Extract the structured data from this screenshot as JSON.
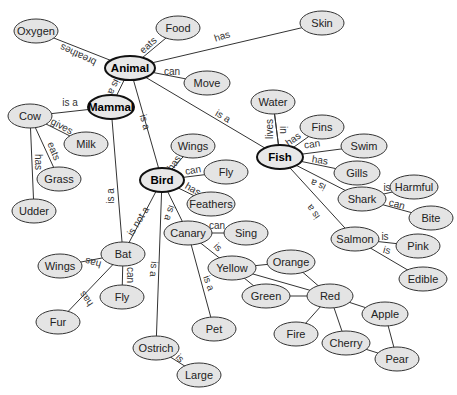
{
  "diagram": {
    "type": "concept-map",
    "colors": {
      "node_fill": "#e4e4e4",
      "node_stroke": "#333333",
      "edge": "#333333",
      "main_node_stroke": "#111111"
    },
    "nodes": [
      {
        "id": "animal",
        "label": "Animal",
        "x": 130,
        "y": 68,
        "rx": 25,
        "ry": 12,
        "main": true
      },
      {
        "id": "mammal",
        "label": "Mammal",
        "x": 111,
        "y": 107,
        "rx": 23,
        "ry": 12,
        "main": true
      },
      {
        "id": "bird",
        "label": "Bird",
        "x": 162,
        "y": 180,
        "rx": 22,
        "ry": 12,
        "main": true
      },
      {
        "id": "fish",
        "label": "Fish",
        "x": 280,
        "y": 157,
        "rx": 23,
        "ry": 12,
        "main": true
      },
      {
        "id": "oxygen",
        "label": "Oxygen",
        "x": 36,
        "y": 31,
        "rx": 22,
        "ry": 12
      },
      {
        "id": "food",
        "label": "Food",
        "x": 178,
        "y": 28,
        "rx": 22,
        "ry": 12
      },
      {
        "id": "skin",
        "label": "Skin",
        "x": 322,
        "y": 23,
        "rx": 22,
        "ry": 12
      },
      {
        "id": "move",
        "label": "Move",
        "x": 207,
        "y": 83,
        "rx": 23,
        "ry": 12
      },
      {
        "id": "cow",
        "label": "Cow",
        "x": 30,
        "y": 116,
        "rx": 22,
        "ry": 12
      },
      {
        "id": "milk",
        "label": "Milk",
        "x": 86,
        "y": 144,
        "rx": 22,
        "ry": 12
      },
      {
        "id": "grass",
        "label": "Grass",
        "x": 59,
        "y": 179,
        "rx": 22,
        "ry": 12
      },
      {
        "id": "udder",
        "label": "Udder",
        "x": 34,
        "y": 211,
        "rx": 22,
        "ry": 12
      },
      {
        "id": "water",
        "label": "Water",
        "x": 273,
        "y": 102,
        "rx": 22,
        "ry": 12
      },
      {
        "id": "fins",
        "label": "Fins",
        "x": 322,
        "y": 127,
        "rx": 22,
        "ry": 12
      },
      {
        "id": "swim",
        "label": "Swim",
        "x": 364,
        "y": 146,
        "rx": 23,
        "ry": 12
      },
      {
        "id": "gills",
        "label": "Gills",
        "x": 357,
        "y": 173,
        "rx": 23,
        "ry": 12
      },
      {
        "id": "shark",
        "label": "Shark",
        "x": 362,
        "y": 199,
        "rx": 24,
        "ry": 12
      },
      {
        "id": "harmful",
        "label": "Harmful",
        "x": 414,
        "y": 187,
        "rx": 24,
        "ry": 12
      },
      {
        "id": "bite",
        "label": "Bite",
        "x": 431,
        "y": 218,
        "rx": 22,
        "ry": 12
      },
      {
        "id": "salmon",
        "label": "Salmon",
        "x": 355,
        "y": 239,
        "rx": 24,
        "ry": 12
      },
      {
        "id": "pink",
        "label": "Pink",
        "x": 418,
        "y": 246,
        "rx": 22,
        "ry": 12
      },
      {
        "id": "edible",
        "label": "Edible",
        "x": 423,
        "y": 279,
        "rx": 24,
        "ry": 12
      },
      {
        "id": "wings_bird",
        "label": "Wings",
        "x": 193,
        "y": 146,
        "rx": 22,
        "ry": 12
      },
      {
        "id": "fly_bird",
        "label": "Fly",
        "x": 226,
        "y": 172,
        "rx": 22,
        "ry": 12
      },
      {
        "id": "feathers",
        "label": "Feathers",
        "x": 211,
        "y": 204,
        "rx": 24,
        "ry": 12
      },
      {
        "id": "canary",
        "label": "Canary",
        "x": 188,
        "y": 233,
        "rx": 24,
        "ry": 12
      },
      {
        "id": "sing",
        "label": "Sing",
        "x": 246,
        "y": 233,
        "rx": 22,
        "ry": 12
      },
      {
        "id": "yellow",
        "label": "Yellow",
        "x": 232,
        "y": 268,
        "rx": 24,
        "ry": 12
      },
      {
        "id": "orange",
        "label": "Orange",
        "x": 291,
        "y": 262,
        "rx": 24,
        "ry": 12
      },
      {
        "id": "green",
        "label": "Green",
        "x": 266,
        "y": 296,
        "rx": 24,
        "ry": 12
      },
      {
        "id": "red",
        "label": "Red",
        "x": 330,
        "y": 296,
        "rx": 23,
        "ry": 12
      },
      {
        "id": "fire",
        "label": "Fire",
        "x": 296,
        "y": 334,
        "rx": 22,
        "ry": 12
      },
      {
        "id": "cherry",
        "label": "Cherry",
        "x": 346,
        "y": 343,
        "rx": 24,
        "ry": 12
      },
      {
        "id": "apple",
        "label": "Apple",
        "x": 385,
        "y": 314,
        "rx": 23,
        "ry": 12
      },
      {
        "id": "pear",
        "label": "Pear",
        "x": 397,
        "y": 359,
        "rx": 22,
        "ry": 12
      },
      {
        "id": "pet",
        "label": "Pet",
        "x": 214,
        "y": 329,
        "rx": 22,
        "ry": 12
      },
      {
        "id": "bat",
        "label": "Bat",
        "x": 123,
        "y": 254,
        "rx": 22,
        "ry": 12
      },
      {
        "id": "wings_bat",
        "label": "Wings",
        "x": 60,
        "y": 266,
        "rx": 22,
        "ry": 12
      },
      {
        "id": "fly_bat",
        "label": "Fly",
        "x": 122,
        "y": 297,
        "rx": 22,
        "ry": 12
      },
      {
        "id": "fur",
        "label": "Fur",
        "x": 58,
        "y": 322,
        "rx": 22,
        "ry": 12
      },
      {
        "id": "ostrich",
        "label": "Ostrich",
        "x": 156,
        "y": 348,
        "rx": 23,
        "ry": 12
      },
      {
        "id": "large",
        "label": "Large",
        "x": 199,
        "y": 375,
        "rx": 22,
        "ry": 12
      }
    ],
    "edges": [
      {
        "from": "animal",
        "to": "oxygen",
        "label": "breathes",
        "lx": 78,
        "ly": 55,
        "angle": 205
      },
      {
        "from": "animal",
        "to": "food",
        "label": "eats",
        "lx": 148,
        "ly": 45,
        "angle": -42
      },
      {
        "from": "animal",
        "to": "skin",
        "label": "has",
        "lx": 222,
        "ly": 36,
        "angle": -18
      },
      {
        "from": "animal",
        "to": "move",
        "label": "can",
        "lx": 172,
        "ly": 71,
        "angle": 0
      },
      {
        "from": "animal",
        "to": "mammal",
        "label": "is a",
        "lx": 114,
        "ly": 87,
        "angle": 115
      },
      {
        "from": "animal",
        "to": "bird",
        "label": "is a",
        "lx": 145,
        "ly": 122,
        "angle": 75
      },
      {
        "from": "animal",
        "to": "fish",
        "label": "is a",
        "lx": 223,
        "ly": 116,
        "angle": 30
      },
      {
        "from": "mammal",
        "to": "cow",
        "label": "is a",
        "lx": 70,
        "ly": 102,
        "angle": 0
      },
      {
        "from": "mammal",
        "to": "bat",
        "label": "is a",
        "lx": 110,
        "ly": 196,
        "angle": -90
      },
      {
        "from": "cow",
        "to": "milk",
        "label": "gives",
        "lx": 62,
        "ly": 126,
        "angle": 28
      },
      {
        "from": "cow",
        "to": "grass",
        "label": "eats",
        "lx": 54,
        "ly": 151,
        "angle": 68
      },
      {
        "from": "cow",
        "to": "udder",
        "label": "has",
        "lx": 38,
        "ly": 162,
        "angle": 90
      },
      {
        "from": "fish",
        "to": "water",
        "label": "lives",
        "lx": 269,
        "ly": 129,
        "angle": -90
      },
      {
        "from": "fish",
        "to": "water",
        "label": "in",
        "lx": 283,
        "ly": 130,
        "angle": 90
      },
      {
        "from": "fish",
        "to": "fins",
        "label": "has",
        "lx": 293,
        "ly": 139,
        "angle": -35
      },
      {
        "from": "fish",
        "to": "swim",
        "label": "can",
        "lx": 312,
        "ly": 144,
        "angle": -8
      },
      {
        "from": "fish",
        "to": "gills",
        "label": "has",
        "lx": 320,
        "ly": 160,
        "angle": 8
      },
      {
        "from": "fish",
        "to": "shark",
        "label": "is a",
        "lx": 318,
        "ly": 185,
        "angle": 205
      },
      {
        "from": "fish",
        "to": "salmon",
        "label": "is a",
        "lx": 313,
        "ly": 212,
        "angle": 235
      },
      {
        "from": "shark",
        "to": "harmful",
        "label": "is",
        "lx": 387,
        "ly": 187,
        "angle": 0
      },
      {
        "from": "shark",
        "to": "bite",
        "label": "can",
        "lx": 397,
        "ly": 204,
        "angle": 15
      },
      {
        "from": "salmon",
        "to": "pink",
        "label": "is",
        "lx": 385,
        "ly": 236,
        "angle": 0
      },
      {
        "from": "salmon",
        "to": "edible",
        "label": "is",
        "lx": 387,
        "ly": 250,
        "angle": 15
      },
      {
        "from": "bird",
        "to": "wings_bird",
        "label": "has",
        "lx": 174,
        "ly": 163,
        "angle": -55
      },
      {
        "from": "bird",
        "to": "fly_bird",
        "label": "can",
        "lx": 193,
        "ly": 170,
        "angle": -10
      },
      {
        "from": "bird",
        "to": "feathers",
        "label": "has",
        "lx": 193,
        "ly": 189,
        "angle": 30
      },
      {
        "from": "bird",
        "to": "canary",
        "label": "is a",
        "lx": 170,
        "ly": 213,
        "angle": 110
      },
      {
        "from": "bird",
        "to": "bat",
        "label": "is not a",
        "lx": 138,
        "ly": 221,
        "angle": -58
      },
      {
        "from": "bird",
        "to": "ostrich",
        "label": "is a",
        "lx": 154,
        "ly": 269,
        "angle": 95
      },
      {
        "from": "canary",
        "to": "sing",
        "label": "can",
        "lx": 217,
        "ly": 225,
        "angle": 0
      },
      {
        "from": "canary",
        "to": "yellow",
        "label": "is",
        "lx": 218,
        "ly": 247,
        "angle": 45
      },
      {
        "from": "canary",
        "to": "pet",
        "label": "is a",
        "lx": 209,
        "ly": 283,
        "angle": 70
      },
      {
        "from": "bat",
        "to": "wings_bat",
        "label": "has",
        "lx": 93,
        "ly": 263,
        "angle": 195
      },
      {
        "from": "bat",
        "to": "fly_bat",
        "label": "can",
        "lx": 130,
        "ly": 275,
        "angle": 90
      },
      {
        "from": "bat",
        "to": "fur",
        "label": "has",
        "lx": 86,
        "ly": 299,
        "angle": 235
      },
      {
        "from": "ostrich",
        "to": "large",
        "label": "is",
        "lx": 180,
        "ly": 358,
        "angle": 45
      },
      {
        "from": "yellow",
        "to": "orange",
        "label": ""
      },
      {
        "from": "yellow",
        "to": "green",
        "label": ""
      },
      {
        "from": "yellow",
        "to": "red",
        "label": ""
      },
      {
        "from": "orange",
        "to": "red",
        "label": ""
      },
      {
        "from": "green",
        "to": "red",
        "label": ""
      },
      {
        "from": "red",
        "to": "fire",
        "label": ""
      },
      {
        "from": "red",
        "to": "cherry",
        "label": ""
      },
      {
        "from": "red",
        "to": "apple",
        "label": ""
      },
      {
        "from": "cherry",
        "to": "pear",
        "label": ""
      },
      {
        "from": "apple",
        "to": "pear",
        "label": ""
      }
    ]
  }
}
